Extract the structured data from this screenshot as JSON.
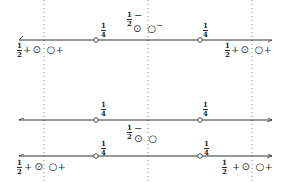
{
  "diagram": {
    "guides": [
      {
        "x": 44
      },
      {
        "x": 148
      },
      {
        "x": 252
      }
    ],
    "lines": [
      {
        "id": "line-1",
        "y": 40,
        "points": [
          {
            "x": 96,
            "label": "1/4"
          },
          {
            "x": 200,
            "label": "1/4"
          }
        ]
      },
      {
        "id": "line-2",
        "y": 120,
        "points": [
          {
            "x": 96,
            "label": "1/4"
          },
          {
            "x": 200,
            "label": "1/4"
          }
        ]
      },
      {
        "id": "line-3",
        "y": 156,
        "points": [
          {
            "x": 96,
            "label": "1/4"
          },
          {
            "x": 200,
            "label": "1/4"
          }
        ]
      }
    ],
    "fraction": {
      "num": "1",
      "den": "4"
    },
    "half": {
      "num": "1",
      "den": "2"
    },
    "plus": "+",
    "minus": "−",
    "dot_circle": "⊙",
    "open_circle": "○",
    "superscript_minus": "−",
    "top_middle": {
      "sign": "−"
    },
    "bottom_middle": {
      "sign": "−"
    }
  }
}
